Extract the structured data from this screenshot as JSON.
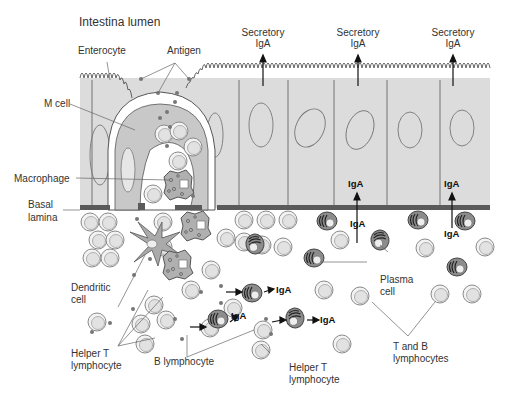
{
  "diagram": {
    "title": "Intestina lumen",
    "labels": {
      "enterocyte": "Enterocyte",
      "antigen": "Antigen",
      "m_cell": "M cell",
      "macrophage": "Macrophage",
      "basal_lamina_1": "Basal",
      "basal_lamina_2": "lamina",
      "dendritic_1": "Dendritic",
      "dendritic_2": "cell",
      "helper_t_left_1": "Helper T",
      "helper_t_left_2": "lymphocyte",
      "b_lymphocyte": "B lymphocyte",
      "helper_t_bottom_1": "Helper T",
      "helper_t_bottom_2": "lymphocyte",
      "plasma_1": "Plasma",
      "plasma_2": "cell",
      "t_and_b_1": "T and B",
      "t_and_b_2": "lymphocytes"
    },
    "secretory_iga": [
      {
        "line1": "Secretory",
        "line2": "IgA"
      },
      {
        "line1": "Secretory",
        "line2": "IgA"
      },
      {
        "line1": "Secretory",
        "line2": "IgA"
      }
    ],
    "iga_labels": {
      "cell_1": "IgA",
      "cell_2": "IgA",
      "below_1": "IgA",
      "below_2": "IgA",
      "plasma_out_1": "IgA",
      "plasma_out_2": "IgA",
      "plasma_out_3": "IgA"
    },
    "colors": {
      "epithelium": "#dcdcdc",
      "m_cell": "#c8c8c8",
      "basal_lamina": "#5a5a5a",
      "lymphocyte_fill": "#e6e6e6",
      "plasma_fill": "#9a9a9a",
      "line": "#555555"
    }
  }
}
